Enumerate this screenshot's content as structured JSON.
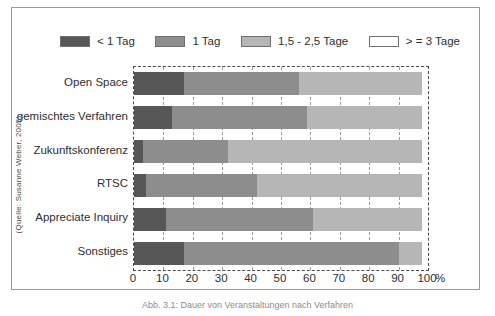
{
  "figure": {
    "source_credit": "(Quelle: Susanne Weber, 2005)",
    "caption": "Abb. 3.1: Dauer von Veranstaltungen nach Verfahren"
  },
  "axis": {
    "unit_label": "%",
    "ticks": [
      "0",
      "10",
      "20",
      "30",
      "40",
      "50",
      "60",
      "70",
      "80",
      "90",
      "100"
    ]
  },
  "colors": {
    "series_1": "#575757",
    "series_2": "#8d8d8d",
    "series_3": "#b6b6b6",
    "series_4": "#ffffff",
    "swatch_border": "#6f6f6f",
    "plot_border": "#4a4a4a",
    "gridline": "#9b9b9b",
    "frame_border": "#9a9a9a",
    "text": "#2e2e2e",
    "background": "#ffffff"
  },
  "legend": {
    "items": [
      {
        "label": "< 1 Tag",
        "color": "#575757"
      },
      {
        "label": "1 Tag",
        "color": "#8d8d8d"
      },
      {
        "label": "1,5 - 2,5 Tage",
        "color": "#b6b6b6"
      },
      {
        "label": "> = 3 Tage",
        "color": "#ffffff"
      }
    ]
  },
  "chart_data": {
    "type": "bar",
    "orientation": "horizontal",
    "stacked": true,
    "title": "",
    "xlabel": "%",
    "ylabel": "",
    "xlim": [
      0,
      100
    ],
    "grid": true,
    "legend_position": "top",
    "categories": [
      "Open Space",
      "gemischtes Verfahren",
      "Zukunftskonferenz",
      "RTSC",
      "Appreciate Inquiry",
      "Sonstiges"
    ],
    "series": [
      {
        "name": "< 1 Tag",
        "color": "#575757",
        "values": [
          17,
          13,
          3,
          4,
          11,
          17
        ]
      },
      {
        "name": "1 Tag",
        "color": "#8d8d8d",
        "values": [
          39,
          46,
          29,
          38,
          50,
          73
        ]
      },
      {
        "name": "1,5 - 2,5 Tage",
        "color": "#b6b6b6",
        "values": [
          42,
          39,
          66,
          56,
          37,
          8
        ]
      },
      {
        "name": "> = 3 Tage",
        "color": "#ffffff",
        "values": [
          2,
          2,
          2,
          2,
          2,
          2
        ]
      }
    ]
  }
}
